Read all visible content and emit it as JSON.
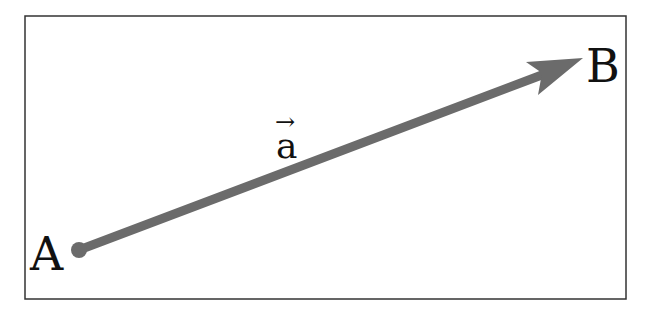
{
  "diagram": {
    "point_start": "A",
    "point_end": "B",
    "vector_label": "a",
    "vector_arrow": "→",
    "colors": {
      "arrow": "#6b6b6b",
      "frame": "#333333",
      "text": "#111111"
    }
  }
}
